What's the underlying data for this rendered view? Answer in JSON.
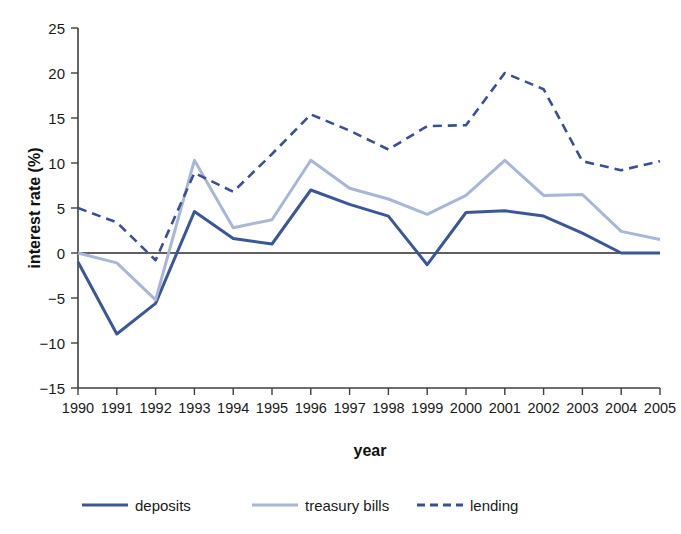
{
  "chart_data": {
    "type": "line",
    "title": "",
    "xlabel": "year",
    "ylabel": "interest rate (%)",
    "xlim": [
      1990,
      2005
    ],
    "ylim": [
      -15,
      25
    ],
    "ytick_step": 5,
    "grid": false,
    "legend_position": "bottom",
    "categories": [
      "1990",
      "1991",
      "1992",
      "1993",
      "1994",
      "1995",
      "1996",
      "1997",
      "1998",
      "1999",
      "2000",
      "2001",
      "2002",
      "2003",
      "2004",
      "2005"
    ],
    "x": [
      1990,
      1991,
      1992,
      1993,
      1994,
      1995,
      1996,
      1997,
      1998,
      1999,
      2000,
      2001,
      2002,
      2003,
      2004,
      2005
    ],
    "yticks": [
      -15,
      -10,
      -5,
      0,
      5,
      10,
      15,
      20,
      25
    ],
    "ytick_labels": [
      "−15",
      "−10",
      "−5",
      "0",
      "5",
      "10",
      "15",
      "20",
      "25"
    ],
    "series": [
      {
        "name": "deposits",
        "color": "#3a5899",
        "style": "solid",
        "width": 3.0,
        "values": [
          -1.0,
          -9.0,
          -5.6,
          4.6,
          1.6,
          1.0,
          7.0,
          5.4,
          4.1,
          -1.3,
          4.5,
          4.7,
          4.1,
          2.2,
          0.0,
          0.0
        ]
      },
      {
        "name": "treasury bills",
        "color": "#a8b6d8",
        "style": "solid",
        "width": 3.0,
        "values": [
          0.0,
          -1.1,
          -5.2,
          10.3,
          2.8,
          3.7,
          10.3,
          7.2,
          6.0,
          4.3,
          6.4,
          10.3,
          6.4,
          6.5,
          2.4,
          1.5
        ]
      },
      {
        "name": "lending",
        "color": "#3a4f99",
        "style": "dashed",
        "width": 2.6,
        "values": [
          5.0,
          3.4,
          -0.8,
          8.9,
          6.8,
          11.0,
          15.4,
          13.6,
          11.5,
          14.1,
          14.2,
          20.0,
          18.2,
          10.2,
          9.2,
          10.2
        ]
      }
    ],
    "legend": [
      {
        "label": "deposits",
        "color": "#3a5899",
        "style": "solid"
      },
      {
        "label": "treasury bills",
        "color": "#a8b6d8",
        "style": "solid"
      },
      {
        "label": "lending",
        "color": "#3a4f99",
        "style": "dashed"
      }
    ]
  },
  "colors": {
    "background": "#ffffff",
    "axis": "#3f3f3f",
    "text": "#1a1a1a",
    "deposits": "#3a5899",
    "treasury_bills": "#a8b6d8",
    "lending": "#3a4f99"
  }
}
